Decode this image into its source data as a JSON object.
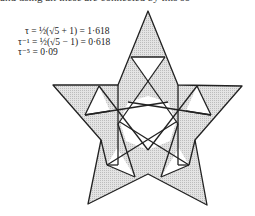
{
  "header": {
    "cropped_text": "and using all these are connected by this so"
  },
  "formulas": [
    "τ = ½(√5 + 1) = 1·618",
    "τ⁻¹ = ½(√5 − 1) = 0·618",
    "τ⁻⁵ = 0·09"
  ],
  "figure": {
    "stroke_color": "#222222",
    "fill_color": "#d6d6d6",
    "center": [
      148,
      122
    ],
    "outer_points": [
      [
        148,
        11
      ],
      [
        242,
        86
      ],
      [
        207,
        205
      ],
      [
        88,
        204
      ],
      [
        53,
        85
      ]
    ],
    "inner_points": [
      [
        118,
        85
      ],
      [
        178,
        85
      ],
      [
        195,
        140
      ],
      [
        148,
        174
      ],
      [
        101,
        140
      ]
    ]
  }
}
